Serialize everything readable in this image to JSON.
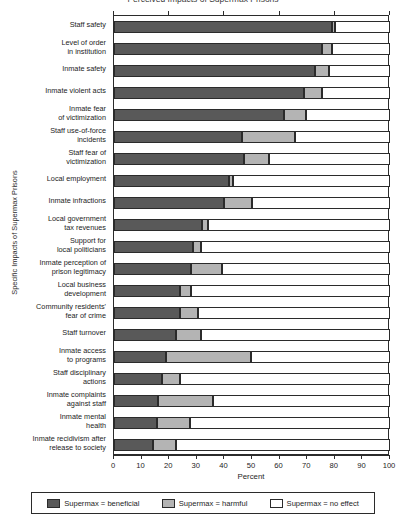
{
  "chart_data": {
    "type": "bar",
    "subtype": "stacked-horizontal-100",
    "title": "Perceived Impacts of Supermax Prisons",
    "xlabel": "Percent",
    "ylabel": "Specific Impacts of Supermax Prisons",
    "xlim": [
      0,
      100
    ],
    "xticks": [
      "0",
      "10",
      "20",
      "30",
      "40",
      "50",
      "60",
      "70",
      "80",
      "90",
      "100"
    ],
    "grid": false,
    "legend_position": "bottom",
    "legend": [
      {
        "key": "beneficial",
        "label": "Supermax = beneficial",
        "color": "#595959"
      },
      {
        "key": "harmful",
        "label": "Supermax = harmful",
        "color": "#b4b4b4"
      },
      {
        "key": "no_effect",
        "label": "Supermax = no effect",
        "color": "#ffffff"
      }
    ],
    "categories": [
      "Staff safety",
      "Level of order\nin institution",
      "Inmate safety",
      "Inmate violent acts",
      "Inmate fear\nof victimization",
      "Staff use-of-force\nincidents",
      "Staff fear of\nvictimization",
      "Local employment",
      "Inmate infractions",
      "Local government\ntax revenues",
      "Support for\nlocal politicians",
      "Inmate perception of\nprison legitimacy",
      "Local business\ndevelopment",
      "Community residents'\nfear of crime",
      "Staff turnover",
      "Inmate access\nto programs",
      "Staff disciplinary\nactions",
      "Inmate complaints\nagainst staff",
      "Inmate mental\nhealth",
      "Inmate recidivism after\nrelease to society"
    ],
    "series": [
      {
        "name": "Supermax = beneficial",
        "values": [
          79,
          75.5,
          73,
          69,
          61.5,
          46.5,
          47,
          41.5,
          40,
          32,
          28.5,
          28,
          24,
          24,
          22.5,
          19,
          17.5,
          16,
          15.5,
          14
        ]
      },
      {
        "name": "Supermax = harmful",
        "values": [
          1,
          3.5,
          5,
          6.5,
          8,
          19,
          9,
          1.5,
          10,
          2,
          3,
          11,
          4,
          6.5,
          9,
          30.5,
          6.5,
          20,
          12,
          8.5
        ]
      },
      {
        "name": "Supermax = no effect",
        "values": [
          20,
          21,
          22,
          24.5,
          30.5,
          34.5,
          44,
          57,
          50,
          66,
          68.5,
          61,
          72,
          69.5,
          68.5,
          50.5,
          76,
          64,
          72.5,
          77.5
        ]
      }
    ]
  }
}
